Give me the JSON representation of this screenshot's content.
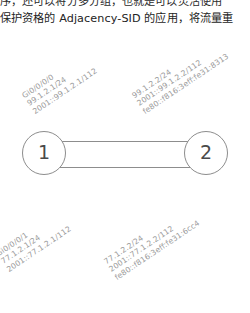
{
  "document": {
    "line1_partial": "序，还可以将分多分组，也就是可以灵活使用",
    "line2": "保护资格的 Adjacency-SID 的应用，将流量重"
  },
  "diagram": {
    "type": "network-topology",
    "colors": {
      "node_stroke": "#8d8d8d",
      "link_stroke": "#8d8d8d",
      "label_text": "#9a9a9a",
      "body_text": "#2b2b2b",
      "background": "#ffffff"
    },
    "nodes": [
      {
        "id": "node-1",
        "label": "1"
      },
      {
        "id": "node-2",
        "label": "2"
      }
    ],
    "links": [
      {
        "id": "link-top",
        "from": "1",
        "to": "2"
      },
      {
        "id": "link-bottom",
        "from": "1",
        "to": "2"
      }
    ],
    "interfaces": [
      {
        "id": "top-left",
        "node": "1",
        "line1": "Gi0/0/0/0",
        "line2": "99.1.2.1/24",
        "line3": "2001::99.1.2.1/112"
      },
      {
        "id": "top-right",
        "node": "2",
        "line1": "99.1.2.2/24",
        "line2": "2001::99.1.2.2/112",
        "line3": "fe80::f816:3eff:fe31:8313"
      },
      {
        "id": "bottom-left",
        "node": "1",
        "line1": "Gi0/0/0/1",
        "line2": "77.1.2.1/24",
        "line3": "2001::77.1.2.1/112"
      },
      {
        "id": "bottom-right",
        "node": "2",
        "line1": "77.1.2.2/24",
        "line2": "2001::77.1.2.2/112",
        "line3": "fe80::f816:3eff:fe31:6cc4"
      }
    ]
  }
}
